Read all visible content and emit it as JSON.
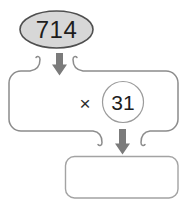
{
  "diagram": {
    "title_hint": "multiplication flow diagram",
    "input_value": "714",
    "operator": "×",
    "multiplier": "31",
    "result_value": "",
    "colors": {
      "oval_fill": "#d7d7d7",
      "oval_border": "#4f4f4f",
      "container_border": "#8c8c8c",
      "circle_border": "#9b9b9b",
      "result_box_border": "#a3a3a3",
      "arrow_fill": "#7b7b7b",
      "text": "#1d1d1d"
    }
  }
}
